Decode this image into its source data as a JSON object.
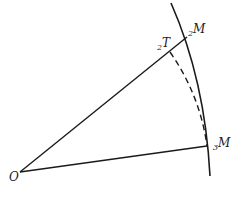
{
  "diagram": {
    "labels": {
      "origin": "O",
      "t2_sub": "2",
      "t2_main": "T",
      "m2_sub": "2",
      "m2_main": "M",
      "m3_sub": "3",
      "m3_main": "M"
    },
    "colors": {
      "stroke": "#1a1a1a",
      "background": "#ffffff"
    }
  }
}
